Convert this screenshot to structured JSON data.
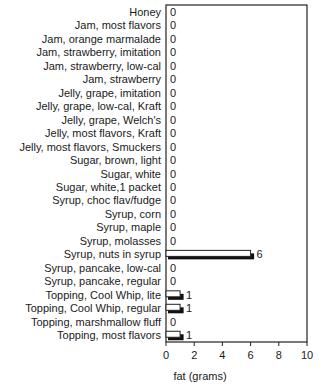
{
  "chart_data": {
    "type": "bar",
    "orientation": "horizontal",
    "title": "",
    "xlabel": "fat (grams)",
    "ylabel": "",
    "xlim": [
      0,
      10
    ],
    "xticks": [
      0,
      2,
      4,
      6,
      8,
      10
    ],
    "grid": false,
    "legend": null,
    "categories": [
      "Honey",
      "Jam, most flavors",
      "Jam, orange marmalade",
      "Jam, strawberry, imitation",
      "Jam, strawberry, low-cal",
      "Jam, strawberry",
      "Jelly, grape, imitation",
      "Jelly, grape, low-cal, Kraft",
      "Jelly, grape, Welch's",
      "Jelly, most flavors, Kraft",
      "Jelly, most flavors, Smuckers",
      "Sugar, brown, light",
      "Sugar, white",
      "Sugar, white,1 packet",
      "Syrup, choc flav/fudge",
      "Syrup, corn",
      "Syrup, maple",
      "Syrup, molasses",
      "Syrup, nuts in syrup",
      "Syrup, pancake, low-cal",
      "Syrup, pancake, regular",
      "Topping, Cool Whip, lite",
      "Topping, Cool Whip, regular",
      "Topping, marshmallow fluff",
      "Topping, most flavors"
    ],
    "values": [
      0,
      0,
      0,
      0,
      0,
      0,
      0,
      0,
      0,
      0,
      0,
      0,
      0,
      0,
      0,
      0,
      0,
      0,
      6,
      0,
      0,
      1,
      1,
      0,
      1
    ],
    "value_labels": [
      "0",
      "0",
      "0",
      "0",
      "0",
      "0",
      "0",
      "0",
      "0",
      "0",
      "0",
      "0",
      "0",
      "0",
      "0",
      "0",
      "0",
      "0",
      "6",
      "0",
      "0",
      "1",
      "1",
      "0",
      "1"
    ],
    "style": {
      "bar_fill": "#ffffff",
      "bar_shadow": "#111111",
      "axis_color": "#222222"
    }
  }
}
